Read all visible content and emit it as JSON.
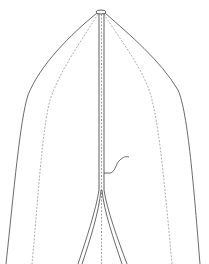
{
  "figure": {
    "type": "patent-line-drawing",
    "background": "#ffffff",
    "stroke_color": "#333333",
    "dashed_stroke_color": "#888888",
    "labels": [],
    "parts": [
      {
        "name": "apex-cap",
        "description": "small ring at top center"
      },
      {
        "name": "central-stem",
        "description": "vertical double line with dashed center"
      },
      {
        "name": "outer-left-profile",
        "description": "solid curve from apex to bottom-left"
      },
      {
        "name": "inner-left-profile",
        "description": "dashed curve from apex to bottom-left"
      },
      {
        "name": "outer-right-profile",
        "description": "solid curve from apex to bottom-right"
      },
      {
        "name": "inner-right-profile",
        "description": "dashed curve from apex to bottom-right"
      },
      {
        "name": "split-legs",
        "description": "stem splits into two diverging strands"
      },
      {
        "name": "leader-line",
        "description": "curved reference leader pointing to stem"
      }
    ]
  }
}
